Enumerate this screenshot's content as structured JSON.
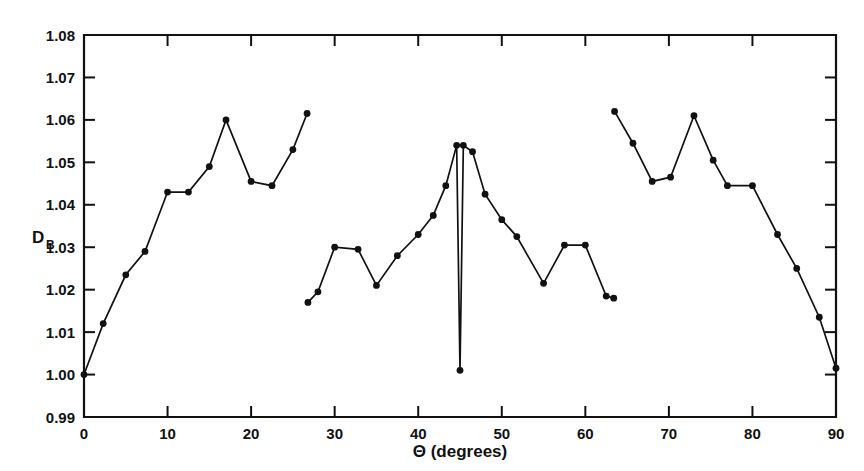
{
  "chart_data": {
    "type": "line",
    "title": "",
    "subtitle": "",
    "xlabel": "Θ (degrees)",
    "ylabel": "D",
    "ylabel_subscript": "B",
    "xlim": [
      0,
      90
    ],
    "ylim": [
      0.99,
      1.08
    ],
    "grid": false,
    "legend": null,
    "x_ticks": [
      0,
      10,
      20,
      30,
      40,
      50,
      60,
      70,
      80,
      90
    ],
    "x_tick_labels": [
      "0",
      "10",
      "20",
      "30",
      "40",
      "50",
      "60",
      "70",
      "80",
      "90"
    ],
    "y_ticks": [
      0.99,
      1.0,
      1.01,
      1.02,
      1.03,
      1.04,
      1.05,
      1.06,
      1.07,
      1.08
    ],
    "y_tick_labels": [
      "0.99",
      "1.00",
      "1.01",
      "1.02",
      "1.03",
      "1.04",
      "1.05",
      "1.06",
      "1.07",
      "1.08"
    ],
    "marker": "filled-circle",
    "series": [
      {
        "name": "segment-1",
        "x": [
          0.0,
          2.3,
          5.0,
          7.3,
          10.0,
          12.5,
          15.0,
          17.0,
          20.0,
          22.5,
          25.0,
          26.7
        ],
        "values": [
          1.0,
          1.012,
          1.0235,
          1.029,
          1.043,
          1.043,
          1.049,
          1.06,
          1.0455,
          1.0445,
          1.053,
          1.0615
        ]
      },
      {
        "name": "segment-2",
        "x": [
          26.8,
          28.0,
          30.0,
          32.8,
          35.0,
          37.5,
          40.0,
          41.8,
          43.3,
          44.6,
          45.4,
          46.5,
          48.0,
          50.0,
          51.8,
          55.0,
          57.5,
          60.0,
          62.5,
          63.4
        ],
        "values": [
          1.017,
          1.0195,
          1.03,
          1.0295,
          1.021,
          1.028,
          1.033,
          1.0375,
          1.0445,
          1.054,
          1.054,
          1.0525,
          1.0425,
          1.0365,
          1.0325,
          1.0215,
          1.0305,
          1.0305,
          1.0185,
          1.018
        ]
      },
      {
        "name": "segment-2-notch",
        "x": [
          44.6,
          45.0,
          45.4
        ],
        "values": [
          1.054,
          1.001,
          1.054
        ]
      },
      {
        "name": "segment-3",
        "x": [
          63.5,
          65.7,
          68.0,
          70.2,
          73.0,
          75.3,
          77.0,
          80.0,
          83.0,
          85.3,
          88.0,
          90.0
        ],
        "values": [
          1.062,
          1.0545,
          1.0455,
          1.0465,
          1.061,
          1.0505,
          1.0445,
          1.0445,
          1.033,
          1.025,
          1.0135,
          1.0015
        ]
      }
    ]
  }
}
